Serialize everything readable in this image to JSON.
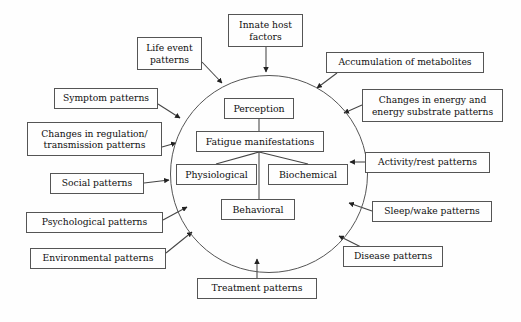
{
  "diagram": {
    "core": {
      "shape": "circle",
      "name": "core-circle",
      "nodes": [
        {
          "id": "perception",
          "label": "Perception",
          "x": 224,
          "y": 98,
          "w": 70,
          "h": 21
        },
        {
          "id": "fatigue-manifestations",
          "label": "Fatigue manifestations",
          "x": 196,
          "y": 131,
          "w": 128,
          "h": 21
        },
        {
          "id": "physiological",
          "label": "Physiological",
          "x": 176,
          "y": 164,
          "w": 81,
          "h": 21
        },
        {
          "id": "biochemical",
          "label": "Biochemical",
          "x": 268,
          "y": 164,
          "w": 80,
          "h": 21
        },
        {
          "id": "behavioral",
          "label": "Behavioral",
          "x": 221,
          "y": 199,
          "w": 74,
          "h": 21
        }
      ]
    },
    "influences": [
      {
        "id": "life-event-patterns",
        "label": "Life event\npatterns",
        "x": 137,
        "y": 37,
        "w": 65,
        "h": 33,
        "lines": [
          "Life event",
          "patterns"
        ]
      },
      {
        "id": "innate-host-factors",
        "label": "Innate host\nfactors",
        "x": 228,
        "y": 14,
        "w": 75,
        "h": 33,
        "lines": [
          "Innate host",
          "factors"
        ]
      },
      {
        "id": "accumulation-of-metabolites",
        "label": "Accumulation of metabolites",
        "x": 326,
        "y": 52,
        "w": 158,
        "h": 21,
        "lines": [
          "Accumulation of metabolites"
        ]
      },
      {
        "id": "changes-in-energy",
        "label": "Changes in energy and\nenergy substrate patterns",
        "x": 362,
        "y": 89,
        "w": 141,
        "h": 33,
        "lines": [
          "Changes in energy and",
          "energy substrate patterns"
        ]
      },
      {
        "id": "activity-rest-patterns",
        "label": "Activity/rest patterns",
        "x": 365,
        "y": 152,
        "w": 125,
        "h": 21,
        "lines": [
          "Activity/rest patterns"
        ]
      },
      {
        "id": "sleep-wake-patterns",
        "label": "Sleep/wake patterns",
        "x": 372,
        "y": 201,
        "w": 120,
        "h": 21,
        "lines": [
          "Sleep/wake patterns"
        ]
      },
      {
        "id": "disease-patterns",
        "label": "Disease patterns",
        "x": 343,
        "y": 246,
        "w": 100,
        "h": 21,
        "lines": [
          "Disease patterns"
        ]
      },
      {
        "id": "treatment-patterns",
        "label": "Treatment patterns",
        "x": 197,
        "y": 278,
        "w": 120,
        "h": 21,
        "lines": [
          "Treatment patterns"
        ]
      },
      {
        "id": "environmental-patterns",
        "label": "Environmental patterns",
        "x": 30,
        "y": 248,
        "w": 136,
        "h": 21,
        "lines": [
          "Environmental patterns"
        ]
      },
      {
        "id": "psychological-patterns",
        "label": "Psychological patterns",
        "x": 26,
        "y": 212,
        "w": 137,
        "h": 21,
        "lines": [
          "Psychological patterns"
        ]
      },
      {
        "id": "social-patterns",
        "label": "Social patterns",
        "x": 50,
        "y": 173,
        "w": 94,
        "h": 21,
        "lines": [
          "Social patterns"
        ]
      },
      {
        "id": "changes-in-regulation",
        "label": "Changes in regulation/\ntransmission patterns",
        "x": 27,
        "y": 122,
        "w": 135,
        "h": 34,
        "lines": [
          "Changes in regulation/",
          "transmission patterns"
        ]
      },
      {
        "id": "symptom-patterns",
        "label": "Symptom patterns",
        "x": 54,
        "y": 88,
        "w": 104,
        "h": 21,
        "lines": [
          "Symptom patterns"
        ]
      }
    ],
    "colors": {
      "stroke": "#555555",
      "text": "#0f0f0f",
      "background": "#fefefe"
    }
  }
}
